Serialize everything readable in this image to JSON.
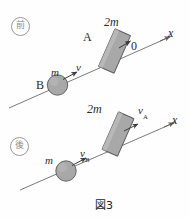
{
  "figure": {
    "caption": "図3",
    "panels": [
      {
        "badge": "前",
        "badge_meaning": "before",
        "axis_label": "x",
        "block": {
          "mass_label": "2m",
          "name_label": "A",
          "velocity_label": "0"
        },
        "ball": {
          "mass_label": "m",
          "name_label": "B",
          "velocity_label": "v"
        }
      },
      {
        "badge": "後",
        "badge_meaning": "after",
        "axis_label": "x",
        "block": {
          "mass_label": "2m",
          "velocity_label": "v",
          "velocity_sub": "A"
        },
        "ball": {
          "mass_label": "m",
          "velocity_label": "v",
          "velocity_sub": "B"
        }
      }
    ]
  },
  "colors": {
    "line": "#6b6b6b",
    "block_fill": "#a8a8a8",
    "block_stroke": "#595959",
    "ball_fill": "#a8a8a8",
    "ball_stroke": "#595959",
    "text": "#2a2a2a",
    "badge": "#8d8d8d",
    "background": "#fefefe"
  }
}
